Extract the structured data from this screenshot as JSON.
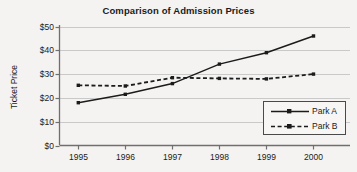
{
  "chart_data": {
    "type": "line",
    "title": "Comparison of Admission Prices",
    "xlabel": "",
    "ylabel": "Ticket Price",
    "categories": [
      "1995",
      "1996",
      "1997",
      "1998",
      "1999",
      "2000"
    ],
    "x": [
      1995,
      1996,
      1997,
      1998,
      1999,
      2000
    ],
    "xlim": [
      1994.6,
      2000.5
    ],
    "ylim": [
      0,
      50
    ],
    "yticks": [
      0,
      10,
      20,
      30,
      40,
      50
    ],
    "ytick_labels": [
      "$0",
      "$10",
      "$20",
      "$30",
      "$40",
      "$50"
    ],
    "grid": "horizontal",
    "legend_position": "lower-right-inside",
    "series": [
      {
        "name": "Park A",
        "style": "solid",
        "marker": "square",
        "color": "#1b1b1b",
        "values": [
          18.0,
          21.5,
          26.0,
          34.2,
          39.0,
          46.0
        ]
      },
      {
        "name": "Park B",
        "style": "dashed",
        "marker": "square",
        "color": "#1b1b1b",
        "values": [
          25.3,
          25.0,
          28.5,
          28.2,
          28.0,
          30.0
        ]
      }
    ]
  },
  "legend": {
    "entries": [
      {
        "label": "Park A"
      },
      {
        "label": "Park B"
      }
    ]
  },
  "colors": {
    "background": "#f4f3f1",
    "axis": "#6f6f6f",
    "grid": "#c9c9c9",
    "ink": "#1b1b1b"
  }
}
